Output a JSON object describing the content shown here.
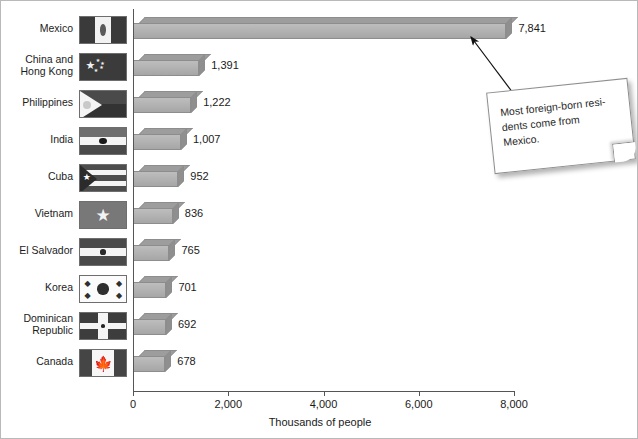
{
  "chart_data": {
    "type": "bar",
    "orientation": "horizontal",
    "title": "",
    "xlabel": "Thousands of people",
    "ylabel": "",
    "xlim": [
      0,
      8000
    ],
    "xticks": [
      "0",
      "2,000",
      "4,000",
      "6,000",
      "8,000"
    ],
    "xtick_values": [
      0,
      2000,
      4000,
      6000,
      8000
    ],
    "grid": false,
    "legend": "none",
    "categories": [
      "Mexico",
      "China and\nHong Kong",
      "Philippines",
      "India",
      "Cuba",
      "Vietnam",
      "El Salvador",
      "Korea",
      "Dominican\nRepublic",
      "Canada"
    ],
    "values": [
      7841,
      1391,
      1222,
      1007,
      952,
      836,
      765,
      701,
      692,
      678
    ],
    "value_labels": [
      "7,841",
      "1,391",
      "1,222",
      "1,007",
      "952",
      "836",
      "765",
      "701",
      "692",
      "678"
    ],
    "flags": [
      "flag-mexico",
      "flag-china",
      "flag-philippines",
      "flag-india",
      "flag-cuba",
      "flag-vietnam",
      "flag-el-salvador",
      "flag-korea",
      "flag-dominican-republic",
      "flag-canada"
    ],
    "annotation": {
      "text": "Most foreign-born resi-dents come from Mexico.",
      "lines": [
        "Most foreign-born resi-",
        "dents come from",
        "Mexico."
      ],
      "points_to": "Mexico"
    },
    "colors": {
      "bar_front": "#b3b3b3",
      "bar_top": "#9d9d9d",
      "bar_side": "#8f8f8f",
      "bar_outline": "#8d8d8d",
      "axis": "#555555",
      "text": "#1a1a1a",
      "note_bg": "#ffffff"
    }
  }
}
